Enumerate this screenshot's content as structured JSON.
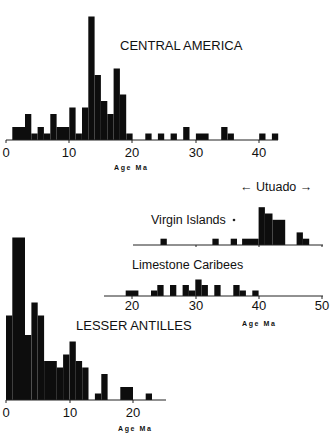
{
  "chart_data": [
    {
      "type": "bar",
      "title": "CENTRAL AMERICA",
      "xlabel": "Age Ma",
      "ylabel": "",
      "xlim": [
        0,
        44
      ],
      "x_ticks": [
        0,
        10,
        20,
        30,
        40
      ],
      "bin_width": 1,
      "bins": [
        {
          "x0": 1,
          "x1": 3,
          "count": 2
        },
        {
          "x0": 3,
          "x1": 4,
          "count": 4
        },
        {
          "x0": 4,
          "x1": 5,
          "count": 1
        },
        {
          "x0": 5,
          "x1": 6,
          "count": 2
        },
        {
          "x0": 6,
          "x1": 7,
          "count": 1
        },
        {
          "x0": 7,
          "x1": 8,
          "count": 4
        },
        {
          "x0": 8,
          "x1": 10,
          "count": 2
        },
        {
          "x0": 10,
          "x1": 11,
          "count": 5
        },
        {
          "x0": 11,
          "x1": 12,
          "count": 1
        },
        {
          "x0": 12,
          "x1": 13,
          "count": 5
        },
        {
          "x0": 13,
          "x1": 14,
          "count": 19
        },
        {
          "x0": 14,
          "x1": 15,
          "count": 10
        },
        {
          "x0": 15,
          "x1": 16,
          "count": 6
        },
        {
          "x0": 16,
          "x1": 17,
          "count": 4
        },
        {
          "x0": 17,
          "x1": 18,
          "count": 11
        },
        {
          "x0": 18,
          "x1": 19,
          "count": 7
        },
        {
          "x0": 19,
          "x1": 20,
          "count": 1
        },
        {
          "x0": 22,
          "x1": 23,
          "count": 1
        },
        {
          "x0": 24,
          "x1": 25,
          "count": 1
        },
        {
          "x0": 26,
          "x1": 27,
          "count": 1
        },
        {
          "x0": 28,
          "x1": 29,
          "count": 2
        },
        {
          "x0": 30,
          "x1": 32,
          "count": 1
        },
        {
          "x0": 34,
          "x1": 35,
          "count": 2
        },
        {
          "x0": 35,
          "x1": 36,
          "count": 1
        },
        {
          "x0": 40,
          "x1": 41,
          "count": 1
        },
        {
          "x0": 42,
          "x1": 43,
          "count": 1
        }
      ]
    },
    {
      "type": "bar",
      "title": "Virgin Islands",
      "annotation": "← Utuado →",
      "xlabel": "",
      "xlim": [
        20,
        50
      ],
      "bin_width": 1,
      "bins": [
        {
          "x0": 24.5,
          "x1": 25.5,
          "count": 1
        },
        {
          "x0": 32.7,
          "x1": 33.7,
          "count": 1
        },
        {
          "x0": 35.6,
          "x1": 36.6,
          "count": 1
        },
        {
          "x0": 37.4,
          "x1": 40,
          "count": 1
        },
        {
          "x0": 40,
          "x1": 41,
          "count": 6
        },
        {
          "x0": 41,
          "x1": 42.2,
          "count": 5
        },
        {
          "x0": 42.2,
          "x1": 44.2,
          "count": 4
        },
        {
          "x0": 46,
          "x1": 47,
          "count": 2
        },
        {
          "x0": 47,
          "x1": 48,
          "count": 1
        }
      ]
    },
    {
      "type": "bar",
      "title": "Limestone Caribees",
      "xlabel": "Age Ma",
      "xlim": [
        17,
        50
      ],
      "x_ticks": [
        20,
        30,
        40,
        50
      ],
      "bin_width": 1,
      "bins": [
        {
          "x0": 19,
          "x1": 21,
          "count": 1
        },
        {
          "x0": 23,
          "x1": 24,
          "count": 1
        },
        {
          "x0": 24,
          "x1": 25,
          "count": 2
        },
        {
          "x0": 26,
          "x1": 27,
          "count": 2
        },
        {
          "x0": 28,
          "x1": 29,
          "count": 2
        },
        {
          "x0": 29,
          "x1": 30,
          "count": 1
        },
        {
          "x0": 30,
          "x1": 31,
          "count": 3
        },
        {
          "x0": 31,
          "x1": 32,
          "count": 2
        },
        {
          "x0": 33,
          "x1": 34,
          "count": 2
        },
        {
          "x0": 36,
          "x1": 37,
          "count": 2
        },
        {
          "x0": 37,
          "x1": 38,
          "count": 1
        },
        {
          "x0": 39,
          "x1": 40,
          "count": 1
        }
      ]
    },
    {
      "type": "bar",
      "title": "LESSER ANTILLES",
      "xlabel": "Age Ma",
      "xlim": [
        0,
        25
      ],
      "x_ticks": [
        0,
        10,
        20
      ],
      "bin_width": 1,
      "bins": [
        {
          "x0": 0,
          "x1": 1,
          "count": 13
        },
        {
          "x0": 1,
          "x1": 3,
          "count": 25
        },
        {
          "x0": 3,
          "x1": 4,
          "count": 10
        },
        {
          "x0": 4,
          "x1": 5,
          "count": 15
        },
        {
          "x0": 5,
          "x1": 6,
          "count": 13
        },
        {
          "x0": 6,
          "x1": 8,
          "count": 6
        },
        {
          "x0": 8,
          "x1": 9,
          "count": 5
        },
        {
          "x0": 9,
          "x1": 10,
          "count": 7
        },
        {
          "x0": 10,
          "x1": 11,
          "count": 9
        },
        {
          "x0": 11,
          "x1": 12,
          "count": 6
        },
        {
          "x0": 12,
          "x1": 13,
          "count": 5
        },
        {
          "x0": 14,
          "x1": 15,
          "count": 1
        },
        {
          "x0": 15,
          "x1": 16,
          "count": 4
        },
        {
          "x0": 18,
          "x1": 20,
          "count": 2
        },
        {
          "x0": 22,
          "x1": 23,
          "count": 1
        }
      ]
    }
  ],
  "labels": {
    "central_america": "CENTRAL AMERICA",
    "virgin_islands": "Virgin Islands",
    "utuado": "← Utuado →",
    "limestone_caribees": "Limestone Caribees",
    "lesser_antilles": "LESSER ANTILLES",
    "age_ma": "Age Ma"
  },
  "ticks": {
    "central": [
      "0",
      "10",
      "20",
      "30",
      "40"
    ],
    "caribees": [
      "20",
      "30",
      "40",
      "50"
    ],
    "lesser": [
      "0",
      "10",
      "20"
    ]
  }
}
